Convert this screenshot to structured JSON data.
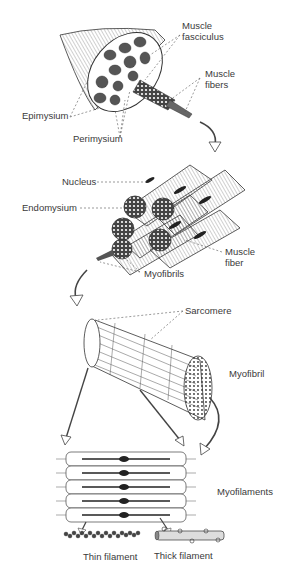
{
  "diagram": {
    "labels": {
      "muscle_fasciculus_1": "Muscle",
      "muscle_fasciculus_2": "fasciculus",
      "muscle_fibers_1": "Muscle",
      "muscle_fibers_2": "fibers",
      "epimysium": "Epimysium",
      "perimysium": "Perimysium",
      "nucleus": "Nucleus",
      "endomysium": "Endomysium",
      "muscle_fiber_1": "Muscle",
      "muscle_fiber_2": "fiber",
      "myofibrils": "Myofibrils",
      "sarcomere": "Sarcomere",
      "myofibril": "Myofibril",
      "myofilaments": "Myofilaments",
      "thin_filament": "Thin filament",
      "thick_filament": "Thick filament"
    },
    "colors": {
      "line": "#333333",
      "fill": "#ffffff",
      "dark": "#222222",
      "label": "#3a3a3a"
    }
  }
}
